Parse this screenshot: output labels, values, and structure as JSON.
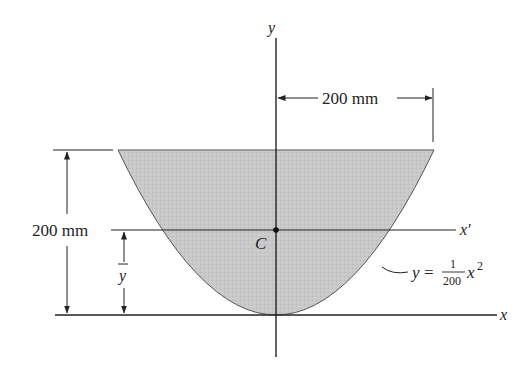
{
  "diagram": {
    "type": "centroid-of-area",
    "shape": {
      "description": "Parabolic area bounded by y = x^2/200 and y = 200 mm",
      "fill_color": "#c8c8c8",
      "stroke_color": "#555555"
    },
    "axes": {
      "y_label": "y",
      "x_label": "x",
      "x_prime_label": "x′"
    },
    "centroid": {
      "label": "C"
    },
    "dimensions": {
      "half_width": "200 mm",
      "height": "200 mm",
      "ybar_label": "y"
    },
    "equation": {
      "lhs": "y",
      "equals": "=",
      "numerator": "1",
      "denominator": "200",
      "variable": "x",
      "exponent": "2"
    }
  }
}
